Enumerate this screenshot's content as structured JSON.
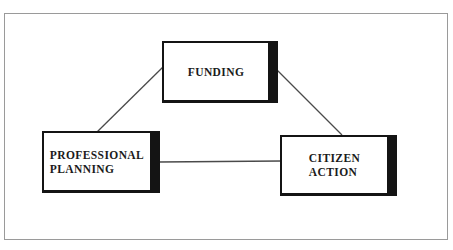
{
  "diagram": {
    "nodes": {
      "funding": {
        "label": "FUNDING"
      },
      "professional_planning": {
        "line1": "PROFESSIONAL",
        "line2": "PLANNING"
      },
      "citizen_action": {
        "line1": "CITIZEN",
        "line2": "ACTION"
      }
    },
    "edges": [
      {
        "from": "professional_planning",
        "to": "funding"
      },
      {
        "from": "funding",
        "to": "citizen_action"
      },
      {
        "from": "professional_planning",
        "to": "citizen_action"
      }
    ],
    "colors": {
      "background": "#ffffff",
      "frame_border": "#9a9a9a",
      "box_border": "#141414",
      "box_shadow_bar": "#141414",
      "text": "#1b1b1b",
      "connector_line": "#4a4a4a"
    }
  }
}
